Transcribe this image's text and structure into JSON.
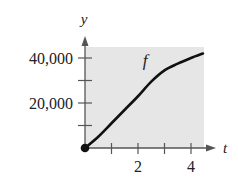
{
  "chart_data": {
    "type": "line",
    "title": "",
    "xlabel": "t",
    "ylabel": "y",
    "series": [
      {
        "name": "f",
        "x": [
          0,
          0.5,
          1,
          1.5,
          2,
          2.5,
          3,
          3.5,
          4,
          4.45
        ],
        "values": [
          0,
          5000,
          11000,
          17000,
          23000,
          29500,
          34500,
          37500,
          40000,
          42000
        ]
      }
    ],
    "x_ticks": [
      1,
      2,
      3,
      4
    ],
    "x_tick_labels": [
      "",
      "2",
      "",
      "4"
    ],
    "y_ticks": [
      10000,
      20000,
      30000,
      40000
    ],
    "y_tick_labels": [
      "",
      "20,000",
      "",
      "40,000"
    ],
    "xlim": [
      0,
      4.5
    ],
    "ylim": [
      0,
      45000
    ],
    "grid": false,
    "shaded_background": true,
    "start_point": {
      "x": 0,
      "y": 0,
      "filled": true
    },
    "curve_label": "f",
    "colors": {
      "curve": "#111111",
      "shade": "#e6e6e6",
      "axis": "#555555"
    }
  }
}
